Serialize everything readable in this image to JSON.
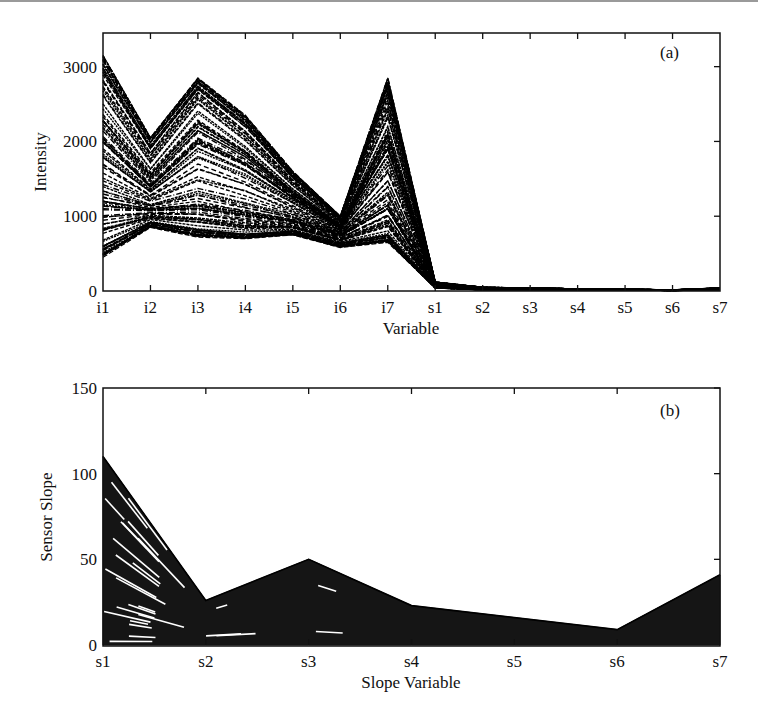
{
  "figure": {
    "panel_a": {
      "tag": "(a)",
      "ylabel": "Intensity",
      "xlabel": "Variable",
      "yticks": [
        "0",
        "1000",
        "2000",
        "3000"
      ],
      "xticks": [
        "i1",
        "i2",
        "i3",
        "i4",
        "i5",
        "i6",
        "i7",
        "s1",
        "s2",
        "s3",
        "s4",
        "s5",
        "s6",
        "s7"
      ]
    },
    "panel_b": {
      "tag": "(b)",
      "ylabel": "Sensor Slope",
      "xlabel": "Slope Variable",
      "yticks": [
        "0",
        "50",
        "100",
        "150"
      ],
      "xticks": [
        "s1",
        "s2",
        "s3",
        "s4",
        "s5",
        "s6",
        "s7"
      ]
    }
  },
  "chart_data": [
    {
      "type": "line",
      "title": "(a)",
      "xlabel": "Variable",
      "ylabel": "Intensity",
      "categories": [
        "i1",
        "i2",
        "i3",
        "i4",
        "i5",
        "i6",
        "i7",
        "s1",
        "s2",
        "s3",
        "s4",
        "s5",
        "s6",
        "s7"
      ],
      "ylim": [
        0,
        3450
      ],
      "yticks": [
        0,
        1000,
        2000,
        3000
      ],
      "grid": false,
      "legend": null,
      "line_style": "dashed, black, many overlapping samples (parallel coordinates)",
      "series": [
        {
          "name": "upper envelope",
          "values": [
            3150,
            2050,
            2850,
            2350,
            1600,
            1000,
            2850,
            120,
            50,
            40,
            30,
            25,
            15,
            40
          ]
        },
        {
          "name": "upper-middle",
          "values": [
            2600,
            1700,
            2500,
            2000,
            1400,
            900,
            2300,
            100,
            40,
            35,
            25,
            20,
            12,
            35
          ]
        },
        {
          "name": "middle",
          "values": [
            2000,
            1400,
            2000,
            1700,
            1250,
            850,
            1900,
            80,
            30,
            30,
            22,
            18,
            10,
            30
          ]
        },
        {
          "name": "lower-middle",
          "values": [
            1200,
            1100,
            1150,
            1050,
            950,
            750,
            1150,
            60,
            25,
            25,
            20,
            15,
            9,
            25
          ]
        },
        {
          "name": "lower band",
          "values": [
            600,
            920,
            820,
            760,
            800,
            640,
            750,
            50,
            20,
            20,
            18,
            14,
            8,
            20
          ]
        },
        {
          "name": "lower envelope",
          "values": [
            450,
            850,
            720,
            700,
            750,
            580,
            650,
            40,
            15,
            15,
            15,
            12,
            6,
            15
          ]
        }
      ]
    },
    {
      "type": "line",
      "title": "(b)",
      "xlabel": "Slope Variable",
      "ylabel": "Sensor Slope",
      "categories": [
        "s1",
        "s2",
        "s3",
        "s4",
        "s5",
        "s6",
        "s7"
      ],
      "ylim": [
        0,
        150
      ],
      "yticks": [
        0,
        50,
        100,
        150
      ],
      "grid": false,
      "legend": null,
      "line_style": "solid, black, many overlapping samples filling region",
      "series": [
        {
          "name": "upper envelope",
          "values": [
            110,
            26,
            50,
            23,
            16,
            9,
            41
          ]
        },
        {
          "name": "upper-middle",
          "values": [
            80,
            22,
            40,
            20,
            14,
            8,
            35
          ]
        },
        {
          "name": "middle",
          "values": [
            45,
            18,
            30,
            16,
            11,
            6,
            25
          ]
        },
        {
          "name": "lower-middle",
          "values": [
            20,
            12,
            18,
            10,
            7,
            4,
            15
          ]
        },
        {
          "name": "lower envelope",
          "values": [
            2,
            2,
            2,
            2,
            2,
            2,
            2
          ]
        }
      ]
    }
  ]
}
